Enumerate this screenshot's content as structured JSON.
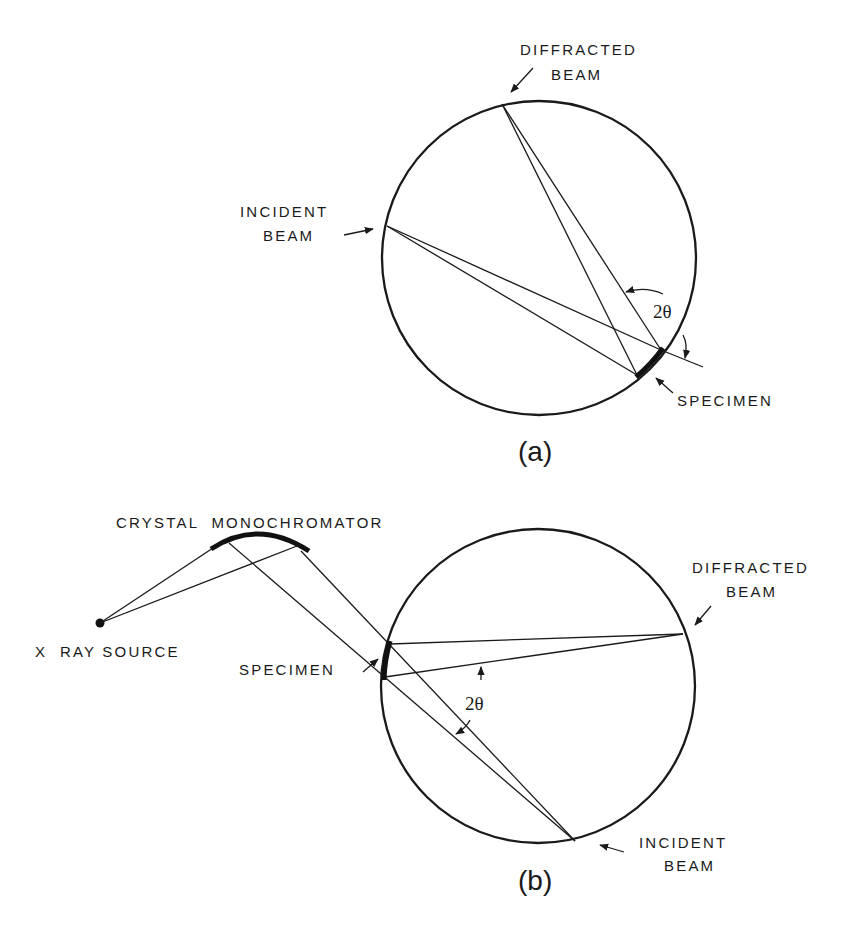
{
  "figure": {
    "panel_a": {
      "caption": "(a)",
      "labels": {
        "diffracted_line1": "DIFFRACTED",
        "diffracted_line2": "BEAM",
        "incident_line1": "INCIDENT",
        "incident_line2": "BEAM",
        "specimen": "SPECIMEN",
        "angle": "2θ"
      }
    },
    "panel_b": {
      "caption": "(b)",
      "labels": {
        "monochromator": "CRYSTAL  MONOCHROMATOR",
        "source": "X  RAY SOURCE",
        "specimen": "SPECIMEN",
        "diffracted_line1": "DIFFRACTED",
        "diffracted_line2": "BEAM",
        "incident_line1": "INCIDENT",
        "incident_line2": "BEAM",
        "angle": "2θ"
      }
    }
  },
  "colors": {
    "ink": "#1a1a1a",
    "background": "#ffffff"
  }
}
